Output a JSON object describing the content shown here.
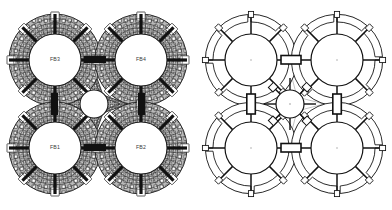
{
  "figure": {
    "background_color": "#ffffff",
    "panel_count": 2,
    "width": 392,
    "height": 210
  },
  "panels": [
    {
      "id": "mesh",
      "name": "finite-element-mesh-panel",
      "render_style": "filled-mesh",
      "description": "Dense quadrilateral finite element mesh of four annular flexure bearings arranged in a 2x2 quad with a central circular hub",
      "line_color": "#1a1a1a",
      "mesh_fill": "#9a9a9a",
      "mesh_light": "#cfcfcf",
      "bore_fill": "#ffffff",
      "labels_visible": true
    },
    {
      "id": "geometry",
      "name": "geometry-line-drawing-panel",
      "render_style": "line-drawing",
      "description": "Clean CAD outline of the same quad assembly showing eight radial spokes, outer arc segments and bold rectangular coupling elements",
      "line_color": "#111111",
      "faint_line_color": "#a8a8a8",
      "fill": "#ffffff",
      "labels_visible": false
    }
  ],
  "assembly": {
    "layout": "2x2-quad-with-central-hub",
    "ring_count": 4,
    "spokes_per_ring": 8,
    "outer_notch_count": 8,
    "hub": {
      "name": "central-hub",
      "shape": "circle-with-eight-point-star-surround",
      "star_points": 8,
      "center": [
        94,
        104
      ],
      "radius": 14
    },
    "rings": [
      {
        "label": "FB3",
        "name": "flexure-bearing-fb3",
        "position": "top-left",
        "center": [
          55,
          60
        ],
        "outer_radius": 47,
        "bore_radius": 26
      },
      {
        "label": "FB4",
        "name": "flexure-bearing-fb4",
        "position": "top-right",
        "center": [
          141,
          60
        ],
        "outer_radius": 47,
        "bore_radius": 26
      },
      {
        "label": "FB1",
        "name": "flexure-bearing-fb1",
        "position": "bottom-left",
        "center": [
          55,
          148
        ],
        "outer_radius": 47,
        "bore_radius": 26
      },
      {
        "label": "FB2",
        "name": "flexure-bearing-fb2",
        "position": "bottom-right",
        "center": [
          141,
          148
        ],
        "outer_radius": 47,
        "bore_radius": 26
      }
    ],
    "connectors": [
      {
        "name": "coupling-top",
        "orientation": "horizontal",
        "between": [
          "FB3",
          "FB4"
        ]
      },
      {
        "name": "coupling-bottom",
        "orientation": "horizontal",
        "between": [
          "FB1",
          "FB2"
        ]
      },
      {
        "name": "coupling-left",
        "orientation": "vertical",
        "between": [
          "FB3",
          "FB1"
        ]
      },
      {
        "name": "coupling-right",
        "orientation": "vertical",
        "between": [
          "FB4",
          "FB2"
        ]
      }
    ]
  },
  "colors": {
    "ink": "#1a1a1a",
    "mesh_mid": "#9a9a9a",
    "mesh_light": "#cfcfcf",
    "faint": "#a8a8a8",
    "paper": "#ffffff",
    "label_text": "#3a3a3a"
  }
}
